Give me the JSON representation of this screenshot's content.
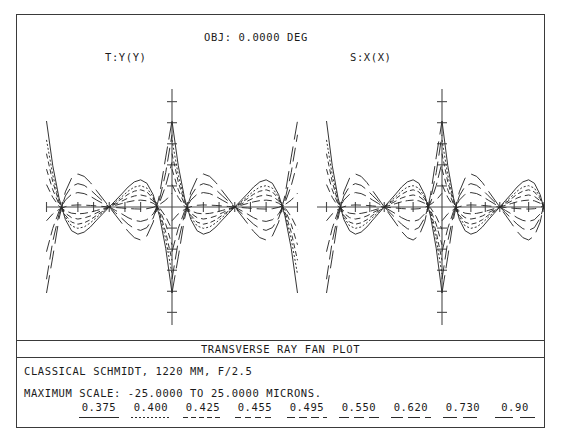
{
  "header": {
    "obj_label": "OBJ: 0.0000 DEG",
    "tangential_label": "T:Y(Y)",
    "sagittal_label": "S:X(X)"
  },
  "footer": {
    "plot_title": "TRANSVERSE RAY FAN PLOT",
    "system_description": "CLASSICAL SCHMIDT, 1220 MM, F/2.5",
    "scale_description": "MAXIMUM SCALE: -25.0000 TO 25.0000 MICRONS."
  },
  "legend": {
    "wavelengths": [
      "0.375",
      "0.400",
      "0.425",
      "0.455",
      "0.495",
      "0.550",
      "0.620",
      "0.730",
      "0.90"
    ],
    "dash_patterns": [
      "solid",
      "2,2",
      "5,3",
      "6,4",
      "8,4",
      "10,5",
      "12,5",
      "14,6",
      "18,7"
    ]
  },
  "colors": {
    "frame": "#3a3a3a",
    "axis": "#4a4a4a",
    "curve": "#2a2a2a",
    "background": "#ffffff"
  },
  "chart_data": {
    "type": "line",
    "title": "TRANSVERSE RAY FAN PLOT",
    "subtitle": "CLASSICAL SCHMIDT, 1220 MM, F/2.5",
    "xlabel": "Normalized pupil coordinate",
    "ylabel": "Transverse ray aberration (microns)",
    "xlim": [
      -1,
      1
    ],
    "ylim": [
      -25,
      25
    ],
    "grid": false,
    "legend_position": "bottom",
    "annotations": [
      "OBJ: 0.0000 DEG",
      "MAXIMUM SCALE: -25.0000 TO 25.0000 MICRONS."
    ],
    "panels": [
      {
        "name": "tangential",
        "axis_label": "T:Y(Y)",
        "x": [
          -1.0,
          -0.9,
          -0.8,
          -0.7,
          -0.6,
          -0.5,
          -0.4,
          -0.3,
          -0.2,
          -0.1,
          0.0,
          0.1,
          0.2,
          0.3,
          0.4,
          0.5,
          0.6,
          0.7,
          0.8,
          0.9,
          1.0
        ],
        "series": [
          {
            "name": "0.375",
            "dash": "solid",
            "values": [
              25.0,
              12.0,
              2.6,
              -3.6,
              -6.9,
              -7.9,
              -7.3,
              -5.8,
              -3.8,
              -1.9,
              0.0,
              1.9,
              3.8,
              5.8,
              7.3,
              7.9,
              6.9,
              3.6,
              -2.6,
              -12.0,
              -25.0
            ]
          },
          {
            "name": "0.400",
            "dash": "2,2",
            "values": [
              19.5,
              9.3,
              1.9,
              -2.9,
              -5.5,
              -6.2,
              -5.8,
              -4.6,
              -3.0,
              -1.5,
              0.0,
              1.5,
              3.0,
              4.6,
              5.8,
              6.2,
              5.5,
              2.9,
              -1.9,
              -9.3,
              -19.5
            ]
          },
          {
            "name": "0.425",
            "dash": "5,3",
            "values": [
              15.5,
              7.3,
              1.4,
              -2.4,
              -4.4,
              -5.0,
              -4.6,
              -3.7,
              -2.4,
              -1.2,
              0.0,
              1.2,
              2.4,
              3.7,
              4.6,
              5.0,
              4.4,
              2.4,
              -1.4,
              -7.3,
              -15.5
            ]
          },
          {
            "name": "0.455",
            "dash": "6,4",
            "values": [
              11.0,
              5.0,
              0.8,
              -1.8,
              -3.1,
              -3.5,
              -3.2,
              -2.6,
              -1.7,
              -0.85,
              0.0,
              0.85,
              1.7,
              2.6,
              3.2,
              3.5,
              3.1,
              1.8,
              -0.8,
              -5.0,
              -11.0
            ]
          },
          {
            "name": "0.495",
            "dash": "8,4",
            "values": [
              6.5,
              2.8,
              0.2,
              -1.1,
              -1.8,
              -2.0,
              -1.85,
              -1.5,
              -1.0,
              -0.5,
              0.0,
              0.5,
              1.0,
              1.5,
              1.85,
              2.0,
              1.8,
              1.1,
              -0.2,
              -2.8,
              -6.5
            ]
          },
          {
            "name": "0.550",
            "dash": "10,5",
            "values": [
              -4.0,
              -2.0,
              -0.7,
              0.1,
              0.5,
              0.6,
              0.55,
              0.45,
              0.3,
              0.15,
              0.0,
              -0.15,
              -0.3,
              -0.45,
              -0.55,
              -0.6,
              -0.5,
              -0.1,
              0.7,
              2.0,
              4.0
            ]
          },
          {
            "name": "0.620",
            "dash": "12,5",
            "values": [
              -13.0,
              -6.2,
              -1.2,
              2.0,
              3.7,
              4.2,
              3.9,
              3.1,
              2.0,
              1.0,
              0.0,
              -1.0,
              -2.0,
              -3.1,
              -3.9,
              -4.2,
              -3.7,
              -2.0,
              1.2,
              6.2,
              13.0
            ]
          },
          {
            "name": "0.730",
            "dash": "14,6",
            "values": [
              -21.0,
              -10.0,
              -2.1,
              3.2,
              6.0,
              6.8,
              6.3,
              5.0,
              3.3,
              1.65,
              0.0,
              -1.65,
              -3.3,
              -5.0,
              -6.3,
              -6.8,
              -6.0,
              -3.2,
              2.1,
              10.0,
              21.0
            ]
          },
          {
            "name": "0.90",
            "dash": "18,7",
            "values": [
              -25.0,
              -14.5,
              -3.4,
              4.4,
              8.4,
              9.6,
              8.9,
              7.1,
              4.7,
              2.35,
              0.0,
              -2.35,
              -4.7,
              -7.1,
              -8.9,
              -9.6,
              -8.4,
              -4.4,
              3.4,
              14.5,
              25.0
            ]
          }
        ]
      },
      {
        "name": "sagittal",
        "axis_label": "S:X(X)",
        "x": [
          -1.0,
          -0.9,
          -0.8,
          -0.7,
          -0.6,
          -0.5,
          -0.4,
          -0.3,
          -0.2,
          -0.1,
          0.0,
          0.1,
          0.2,
          0.3,
          0.4,
          0.5,
          0.6,
          0.7,
          0.8,
          0.9,
          1.0
        ],
        "series": [
          {
            "name": "0.375",
            "dash": "solid",
            "values": [
              25.0,
              12.0,
              2.6,
              -3.6,
              -6.9,
              -7.9,
              -7.3,
              -5.8,
              -3.8,
              -1.9,
              0.0,
              1.9,
              3.8,
              5.8,
              7.3,
              7.9,
              6.9,
              3.6,
              -2.6,
              -12.0,
              -25.0
            ]
          },
          {
            "name": "0.400",
            "dash": "2,2",
            "values": [
              19.5,
              9.3,
              1.9,
              -2.9,
              -5.5,
              -6.2,
              -5.8,
              -4.6,
              -3.0,
              -1.5,
              0.0,
              1.5,
              3.0,
              4.6,
              5.8,
              6.2,
              5.5,
              2.9,
              -1.9,
              -9.3,
              -19.5
            ]
          },
          {
            "name": "0.425",
            "dash": "5,3",
            "values": [
              15.5,
              7.3,
              1.4,
              -2.4,
              -4.4,
              -5.0,
              -4.6,
              -3.7,
              -2.4,
              -1.2,
              0.0,
              1.2,
              2.4,
              3.7,
              4.6,
              5.0,
              4.4,
              2.4,
              -1.4,
              -7.3,
              -15.5
            ]
          },
          {
            "name": "0.455",
            "dash": "6,4",
            "values": [
              11.0,
              5.0,
              0.8,
              -1.8,
              -3.1,
              -3.5,
              -3.2,
              -2.6,
              -1.7,
              -0.85,
              0.0,
              0.85,
              1.7,
              2.6,
              3.2,
              3.5,
              3.1,
              1.8,
              -0.8,
              -5.0,
              -11.0
            ]
          },
          {
            "name": "0.495",
            "dash": "8,4",
            "values": [
              6.5,
              2.8,
              0.2,
              -1.1,
              -1.8,
              -2.0,
              -1.85,
              -1.5,
              -1.0,
              -0.5,
              0.0,
              0.5,
              1.0,
              1.5,
              1.85,
              2.0,
              1.8,
              1.1,
              -0.2,
              -2.8,
              -6.5
            ]
          },
          {
            "name": "0.550",
            "dash": "10,5",
            "values": [
              -4.0,
              -2.0,
              -0.7,
              0.1,
              0.5,
              0.6,
              0.55,
              0.45,
              0.3,
              0.15,
              0.0,
              -0.15,
              -0.3,
              -0.45,
              -0.55,
              -0.6,
              -0.5,
              -0.1,
              0.7,
              2.0,
              4.0
            ]
          },
          {
            "name": "0.620",
            "dash": "12,5",
            "values": [
              -13.0,
              -6.2,
              -1.2,
              2.0,
              3.7,
              4.2,
              3.9,
              3.1,
              2.0,
              1.0,
              0.0,
              -1.0,
              -2.0,
              -3.1,
              -3.9,
              -4.2,
              -3.7,
              -2.0,
              1.2,
              6.2,
              13.0
            ]
          },
          {
            "name": "0.730",
            "dash": "14,6",
            "values": [
              -21.0,
              -10.0,
              -2.1,
              3.2,
              6.0,
              6.8,
              6.3,
              5.0,
              3.3,
              1.65,
              0.0,
              -1.65,
              -3.3,
              -5.0,
              -6.3,
              -6.8,
              -6.0,
              -3.2,
              2.1,
              10.0,
              21.0
            ]
          },
          {
            "name": "0.90",
            "dash": "18,7",
            "values": [
              -25.0,
              -14.5,
              -3.4,
              4.4,
              8.4,
              9.6,
              8.9,
              7.1,
              4.7,
              2.35,
              0.0,
              -2.35,
              -4.7,
              -7.1,
              -8.9,
              -9.6,
              -8.4,
              -4.4,
              3.4,
              14.5,
              25.0
            ]
          }
        ]
      }
    ]
  }
}
